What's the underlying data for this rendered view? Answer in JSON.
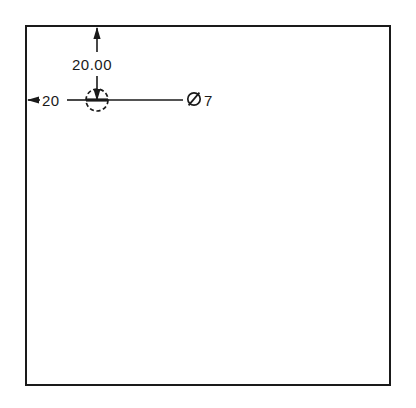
{
  "document": {
    "type": "engineering-drawing",
    "title": "Mechanical part detail drawing",
    "background_color": "#ffffff",
    "line_color": "#1a1a1a"
  },
  "part_outline": {
    "shape": "rectangle",
    "label": "part-outline-rectangle",
    "x": 26,
    "y": 26,
    "width": 364,
    "height": 359,
    "stroke_width": 2
  },
  "features": [
    {
      "name": "hole",
      "shape": "circle",
      "center_x": 97,
      "center_y": 100,
      "radius": 11,
      "dashed": true
    }
  ],
  "dimensions": {
    "vertical": {
      "label": "vertical-dimension",
      "value": "20.00",
      "from_edge": "top",
      "line_x": 97,
      "start_y": 28,
      "end_y": 100
    },
    "horizontal": {
      "label": "horizontal-dimension",
      "value": "20",
      "from_edge": "left",
      "line_y": 100,
      "start_x": 28,
      "end_x": 97
    },
    "diameter_callout": {
      "label": "diameter-callout",
      "symbol": "Ø",
      "value": "7",
      "full_text": "Ø7",
      "leader_start_x": 108,
      "leader_end_x": 183,
      "leader_y": 100
    }
  },
  "annotations": {
    "vertical_dimension_text": "20.00",
    "horizontal_dimension_text": "20",
    "diameter_symbol": "Ø",
    "diameter_value": "7"
  }
}
